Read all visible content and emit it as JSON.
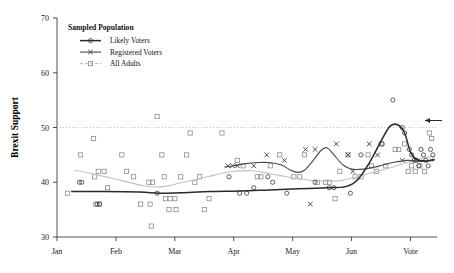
{
  "chart_data": {
    "type": "scatter",
    "title": "",
    "xlabel": "",
    "ylabel": "Brexit Support",
    "ylim": [
      30,
      70
    ],
    "yticks": [
      30,
      40,
      50,
      60,
      70
    ],
    "xticks": [
      "Jan",
      "Feb",
      "Mar",
      "Apr",
      "May",
      "Jun",
      "Vote"
    ],
    "xtick_positions": [
      0,
      1,
      2,
      3,
      4,
      5,
      6
    ],
    "grid": false,
    "legend_position": "top-left",
    "legend_title": "Sampled Population",
    "reference_line": {
      "y": 50,
      "style": "dotted",
      "color": "#b8b8b8"
    },
    "annotation_arrow": {
      "label": "",
      "points_to_y": 50,
      "direction": "left"
    },
    "series": [
      {
        "name": "Likely Voters",
        "marker": "circle",
        "line_color": "#2b2b2b",
        "points": [
          {
            "x": 0.38,
            "y": 40
          },
          {
            "x": 0.42,
            "y": 40
          },
          {
            "x": 0.68,
            "y": 36
          },
          {
            "x": 0.72,
            "y": 36
          },
          {
            "x": 1.7,
            "y": 38
          },
          {
            "x": 2.92,
            "y": 41
          },
          {
            "x": 3.1,
            "y": 38
          },
          {
            "x": 3.22,
            "y": 38
          },
          {
            "x": 3.34,
            "y": 39
          },
          {
            "x": 3.58,
            "y": 41
          },
          {
            "x": 3.66,
            "y": 40
          },
          {
            "x": 3.9,
            "y": 38
          },
          {
            "x": 4.38,
            "y": 40
          },
          {
            "x": 4.62,
            "y": 39
          },
          {
            "x": 4.7,
            "y": 39
          },
          {
            "x": 4.98,
            "y": 38
          },
          {
            "x": 5.16,
            "y": 45
          },
          {
            "x": 5.52,
            "y": 47
          },
          {
            "x": 5.7,
            "y": 55
          },
          {
            "x": 5.86,
            "y": 50
          },
          {
            "x": 5.9,
            "y": 49
          },
          {
            "x": 5.98,
            "y": 46
          },
          {
            "x": 6.02,
            "y": 45
          },
          {
            "x": 6.06,
            "y": 44
          },
          {
            "x": 6.1,
            "y": 44
          },
          {
            "x": 6.14,
            "y": 43
          },
          {
            "x": 6.18,
            "y": 46
          },
          {
            "x": 6.22,
            "y": 45
          },
          {
            "x": 6.26,
            "y": 44
          },
          {
            "x": 6.3,
            "y": 43
          },
          {
            "x": 6.34,
            "y": 46
          },
          {
            "x": 6.38,
            "y": 45
          }
        ],
        "trend": [
          [
            0.25,
            38.3
          ],
          [
            0.8,
            38.3
          ],
          [
            1.4,
            38.2
          ],
          [
            1.75,
            38.0
          ],
          [
            2.1,
            38.1
          ],
          [
            2.6,
            38.3
          ],
          [
            3.1,
            38.4
          ],
          [
            3.6,
            38.6
          ],
          [
            4.1,
            38.8
          ],
          [
            4.6,
            39.0
          ],
          [
            4.9,
            39.2
          ],
          [
            5.1,
            40.4
          ],
          [
            5.3,
            43.5
          ],
          [
            5.5,
            47.5
          ],
          [
            5.65,
            50.2
          ],
          [
            5.78,
            50.5
          ],
          [
            5.9,
            49.0
          ],
          [
            6.0,
            45.5
          ],
          [
            6.1,
            44.2
          ],
          [
            6.25,
            43.9
          ],
          [
            6.4,
            44.2
          ]
        ]
      },
      {
        "name": "Registered Voters",
        "marker": "cross",
        "line_color": "#4a4a4a",
        "points": [
          {
            "x": 2.9,
            "y": 43
          },
          {
            "x": 2.98,
            "y": 43
          },
          {
            "x": 3.06,
            "y": 43
          },
          {
            "x": 3.34,
            "y": 43
          },
          {
            "x": 3.56,
            "y": 45
          },
          {
            "x": 3.86,
            "y": 44
          },
          {
            "x": 4.22,
            "y": 46
          },
          {
            "x": 4.38,
            "y": 46
          },
          {
            "x": 4.3,
            "y": 36
          },
          {
            "x": 4.74,
            "y": 47
          },
          {
            "x": 4.94,
            "y": 45
          },
          {
            "x": 5.02,
            "y": 42
          },
          {
            "x": 5.3,
            "y": 47
          },
          {
            "x": 5.44,
            "y": 45
          },
          {
            "x": 5.86,
            "y": 44
          }
        ],
        "trend": [
          [
            2.85,
            42.8
          ],
          [
            3.0,
            43.0
          ],
          [
            3.2,
            43.4
          ],
          [
            3.4,
            43.6
          ],
          [
            3.6,
            43.6
          ],
          [
            3.8,
            43.2
          ],
          [
            3.95,
            42.3
          ],
          [
            4.08,
            41.8
          ],
          [
            4.2,
            42.2
          ],
          [
            4.35,
            44.0
          ],
          [
            4.48,
            45.8
          ],
          [
            4.58,
            46.3
          ],
          [
            4.7,
            45.0
          ],
          [
            4.85,
            43.2
          ],
          [
            5.0,
            42.4
          ],
          [
            5.2,
            42.4
          ],
          [
            5.45,
            42.9
          ],
          [
            5.7,
            43.6
          ],
          [
            5.95,
            44.0
          ],
          [
            6.2,
            43.8
          ],
          [
            6.4,
            44.0
          ]
        ]
      },
      {
        "name": "All Adults",
        "marker": "square",
        "line_color": "#c2c2c2",
        "points": [
          {
            "x": 0.18,
            "y": 38
          },
          {
            "x": 0.4,
            "y": 45
          },
          {
            "x": 0.62,
            "y": 48
          },
          {
            "x": 0.64,
            "y": 41
          },
          {
            "x": 0.7,
            "y": 42
          },
          {
            "x": 0.8,
            "y": 42
          },
          {
            "x": 0.86,
            "y": 39
          },
          {
            "x": 0.66,
            "y": 36
          },
          {
            "x": 0.72,
            "y": 36
          },
          {
            "x": 1.1,
            "y": 45
          },
          {
            "x": 1.18,
            "y": 42
          },
          {
            "x": 1.3,
            "y": 41
          },
          {
            "x": 1.42,
            "y": 36
          },
          {
            "x": 1.56,
            "y": 40
          },
          {
            "x": 1.62,
            "y": 40
          },
          {
            "x": 1.58,
            "y": 36
          },
          {
            "x": 1.6,
            "y": 32
          },
          {
            "x": 1.7,
            "y": 52
          },
          {
            "x": 1.78,
            "y": 45
          },
          {
            "x": 1.82,
            "y": 41
          },
          {
            "x": 1.84,
            "y": 37
          },
          {
            "x": 1.92,
            "y": 37
          },
          {
            "x": 2.0,
            "y": 37
          },
          {
            "x": 1.9,
            "y": 35
          },
          {
            "x": 2.02,
            "y": 35
          },
          {
            "x": 2.1,
            "y": 41
          },
          {
            "x": 2.2,
            "y": 45
          },
          {
            "x": 2.26,
            "y": 49
          },
          {
            "x": 2.34,
            "y": 40
          },
          {
            "x": 2.42,
            "y": 41
          },
          {
            "x": 2.5,
            "y": 35
          },
          {
            "x": 2.58,
            "y": 37
          },
          {
            "x": 2.8,
            "y": 49
          },
          {
            "x": 3.06,
            "y": 44
          },
          {
            "x": 3.16,
            "y": 43
          },
          {
            "x": 3.4,
            "y": 41
          },
          {
            "x": 3.46,
            "y": 41
          },
          {
            "x": 3.62,
            "y": 43
          },
          {
            "x": 3.78,
            "y": 45
          },
          {
            "x": 4.02,
            "y": 41
          },
          {
            "x": 4.12,
            "y": 41
          },
          {
            "x": 4.2,
            "y": 45
          },
          {
            "x": 4.42,
            "y": 40
          },
          {
            "x": 4.56,
            "y": 40
          },
          {
            "x": 4.62,
            "y": 40
          },
          {
            "x": 4.72,
            "y": 37
          },
          {
            "x": 4.8,
            "y": 42
          },
          {
            "x": 4.94,
            "y": 45
          },
          {
            "x": 5.06,
            "y": 41
          },
          {
            "x": 5.16,
            "y": 41
          },
          {
            "x": 5.28,
            "y": 45
          },
          {
            "x": 5.34,
            "y": 43
          },
          {
            "x": 5.42,
            "y": 42
          },
          {
            "x": 5.5,
            "y": 47
          },
          {
            "x": 5.58,
            "y": 43
          },
          {
            "x": 5.74,
            "y": 46
          },
          {
            "x": 5.8,
            "y": 46
          },
          {
            "x": 5.9,
            "y": 47
          },
          {
            "x": 5.96,
            "y": 42
          },
          {
            "x": 6.02,
            "y": 43
          },
          {
            "x": 6.08,
            "y": 42
          },
          {
            "x": 6.16,
            "y": 43
          },
          {
            "x": 6.24,
            "y": 42
          },
          {
            "x": 6.32,
            "y": 49
          },
          {
            "x": 6.36,
            "y": 48
          }
        ],
        "trend": [
          [
            0.3,
            42.2
          ],
          [
            0.7,
            41.3
          ],
          [
            1.1,
            40.3
          ],
          [
            1.5,
            39.3
          ],
          [
            1.8,
            39.2
          ],
          [
            2.1,
            39.9
          ],
          [
            2.4,
            40.6
          ],
          [
            2.7,
            41.4
          ],
          [
            3.0,
            42.0
          ],
          [
            3.3,
            42.1
          ],
          [
            3.6,
            41.6
          ],
          [
            3.9,
            41.0
          ],
          [
            4.2,
            40.5
          ],
          [
            4.5,
            40.2
          ],
          [
            4.8,
            40.3
          ],
          [
            5.1,
            41.0
          ],
          [
            5.4,
            41.9
          ],
          [
            5.7,
            42.8
          ],
          [
            6.0,
            43.8
          ],
          [
            6.25,
            44.5
          ],
          [
            6.4,
            44.7
          ]
        ]
      }
    ]
  }
}
